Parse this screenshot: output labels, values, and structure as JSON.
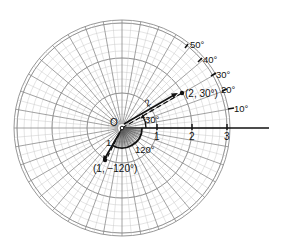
{
  "diagram": {
    "type": "polar-coordinate-grid",
    "origin_label": "O",
    "axis_ticks": [
      "1",
      "2",
      "3"
    ],
    "angle_labels": [
      "10°",
      "20°",
      "30°",
      "40°",
      "50°"
    ],
    "points": [
      {
        "label": "(2, 30°)",
        "r": 2,
        "theta_deg": 30,
        "vector_label": "2"
      },
      {
        "label": "(1, −120°)",
        "r": 1,
        "theta_deg": -120,
        "vector_label": "1"
      }
    ],
    "angle_annotations": [
      {
        "label": "30°",
        "from_deg": 0,
        "to_deg": 30
      },
      {
        "label": "120°",
        "from_deg": 0,
        "to_deg": -120
      }
    ],
    "colors": {
      "grid_major": "#8a8a8a",
      "grid_minor": "#c8c8c8",
      "ink": "#111111",
      "background": "#ffffff"
    }
  }
}
